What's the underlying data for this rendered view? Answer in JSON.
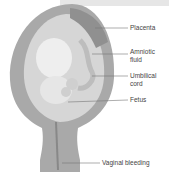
{
  "diagram": {
    "labels": {
      "placenta": "Placenta",
      "amniotic_fluid_1": "Amniotic",
      "amniotic_fluid_2": "fluid",
      "umbilical_cord_1": "Umbilical",
      "umbilical_cord_2": "cord",
      "fetus": "Fetus",
      "vaginal_bleeding": "Vaginal bleeding"
    },
    "colors": {
      "uterus_wall": "#a8a8a8",
      "uterus_inner": "#d8d8d8",
      "fetus": "#ececec",
      "leader": "#777777"
    }
  }
}
